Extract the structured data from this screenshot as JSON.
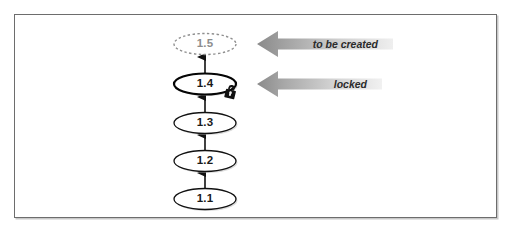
{
  "figure": {
    "type": "revision-chain-diagram",
    "frame": {
      "border_color": "#6d6d6d",
      "background": "#ffffff"
    },
    "nodes": [
      {
        "id": "n1",
        "label": "1.1",
        "state": "committed",
        "style": "solid",
        "cx": 205,
        "cy": 199
      },
      {
        "id": "n2",
        "label": "1.2",
        "state": "committed",
        "style": "solid",
        "cx": 205,
        "cy": 161
      },
      {
        "id": "n3",
        "label": "1.3",
        "state": "committed",
        "style": "solid",
        "cx": 205,
        "cy": 123
      },
      {
        "id": "n4",
        "label": "1.4",
        "state": "locked",
        "style": "solid-bold",
        "cx": 205,
        "cy": 84
      },
      {
        "id": "n5",
        "label": "1.5",
        "state": "to-be-created",
        "style": "dashed",
        "cx": 205,
        "cy": 44
      }
    ],
    "edges": [
      {
        "from": "n1",
        "to": "n2"
      },
      {
        "from": "n2",
        "to": "n3"
      },
      {
        "from": "n3",
        "to": "n4"
      },
      {
        "from": "n4",
        "to": "n5"
      }
    ],
    "callouts": [
      {
        "id": "c1",
        "label": "to be created",
        "target": "n5",
        "direction": "left",
        "color_dark": "#8c8c8c",
        "color_light": "#e8e8e8"
      },
      {
        "id": "c2",
        "label": "locked",
        "target": "n4",
        "direction": "left",
        "color_dark": "#8c8c8c",
        "color_light": "#e4e4e4"
      }
    ],
    "badges": [
      {
        "id": "lock",
        "icon": "padlock-icon",
        "attached_to": "n4",
        "color": "#111111"
      }
    ]
  }
}
